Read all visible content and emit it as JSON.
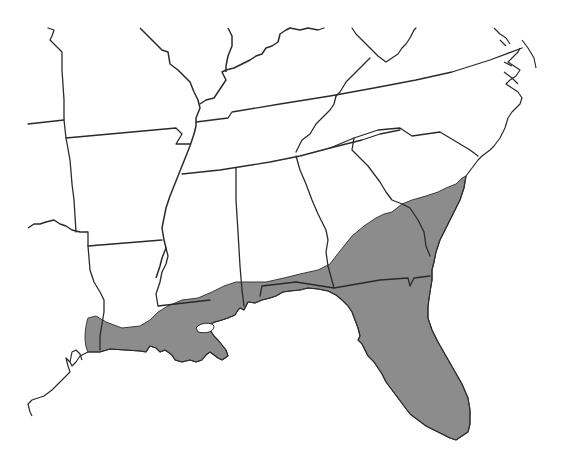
{
  "map": {
    "title": "",
    "region": "Southeastern United States",
    "shaded_color": "#8c8c8c",
    "border_color": "#2a2a2a",
    "background_color": "#ffffff",
    "legend": [],
    "shaded_area_description": "Gulf and South Atlantic coastal plain: southern Louisiana, southern Mississippi, southern Alabama, Florida, southeastern Georgia, coastal South Carolina",
    "states_outlined": [
      "Texas",
      "Oklahoma",
      "Missouri",
      "Arkansas",
      "Louisiana",
      "Illinois",
      "Indiana",
      "Kentucky",
      "Tennessee",
      "Mississippi",
      "Alabama",
      "Georgia",
      "Florida",
      "South Carolina",
      "North Carolina",
      "Virginia",
      "West Virginia",
      "Ohio"
    ],
    "states_shaded_partially": [
      "Louisiana",
      "Mississippi",
      "Alabama",
      "Georgia",
      "South Carolina",
      "Texas"
    ],
    "states_shaded_fully": [
      "Florida"
    ]
  }
}
